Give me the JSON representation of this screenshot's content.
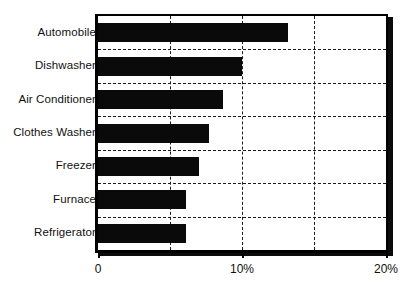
{
  "chart_data": {
    "type": "bar",
    "orientation": "horizontal",
    "title": "",
    "subtitle": "",
    "xlabel": "",
    "ylabel": "",
    "categories": [
      "Refrigerator",
      "Furnace",
      "Freezer",
      "Clothes Washer",
      "Air Conditioner",
      "Dishwasher",
      "Automobile"
    ],
    "values": [
      6.1,
      6.1,
      7.0,
      7.7,
      8.7,
      10.0,
      13.2
    ],
    "series": [
      {
        "name": "",
        "values": [
          6.1,
          6.1,
          7.0,
          7.7,
          8.7,
          10.0,
          13.2
        ]
      }
    ],
    "xlim": [
      0,
      20
    ],
    "xticks": [
      0,
      10,
      20
    ],
    "xtick_labels": [
      "0",
      "10%",
      "20%"
    ],
    "gridlines_x": [
      5,
      10,
      15
    ],
    "grid": true,
    "grid_style": "dashed",
    "legend": false,
    "legend_position": "none",
    "bar_color": "#0a0a0a",
    "axis_color": "#000000",
    "background_color": "#ffffff",
    "units": "%"
  },
  "axis": {
    "ticks": [
      {
        "label": "0",
        "value": 0
      },
      {
        "label": "10%",
        "value": 10
      },
      {
        "label": "20%",
        "value": 20
      }
    ]
  }
}
